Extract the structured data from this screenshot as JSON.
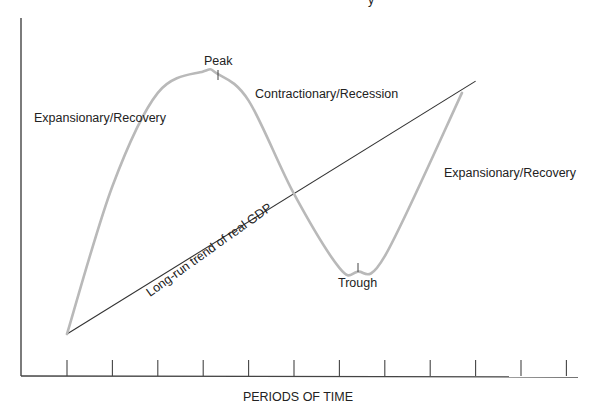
{
  "diagram": {
    "title_fragment": "y",
    "x_axis_title": "PERIODS OF TIME",
    "tick_count": 12,
    "labels": {
      "expansion_left": "Expansionary/Recovery",
      "peak": "Peak",
      "contraction": "Contractionary/Recession",
      "expansion_right": "Expansionary/Recovery",
      "trough": "Trough",
      "trend": "Long-run trend of real GDP"
    },
    "colors": {
      "cycle_curve": "#b9b9b9",
      "trend_line": "#333333",
      "axes": "#444444",
      "text": "#222222"
    }
  },
  "chart_data": {
    "type": "line",
    "title": "",
    "xlabel": "PERIODS OF TIME",
    "ylabel": "",
    "x_ticks": [
      "",
      "",
      "",
      "",
      "",
      "",
      "",
      "",
      "",
      "",
      "",
      ""
    ],
    "series": [
      {
        "name": "Business cycle (real GDP)",
        "style": "smooth-curve",
        "x": [
          0,
          1,
          2,
          3,
          3.3,
          4,
          5,
          6,
          6.4,
          7,
          8.7
        ],
        "y": [
          0,
          3.8,
          6.2,
          6.75,
          6.7,
          6.0,
          3.6,
          1.7,
          1.6,
          2.0,
          6.2
        ]
      },
      {
        "name": "Long-run trend of real GDP",
        "style": "straight-line",
        "x": [
          0,
          9
        ],
        "y": [
          0,
          6.5
        ]
      }
    ],
    "annotations": [
      {
        "text": "Peak",
        "x": 3.3,
        "y": 6.75
      },
      {
        "text": "Trough",
        "x": 6.4,
        "y": 1.6
      },
      {
        "text": "Expansionary/Recovery",
        "phase": "rising before peak"
      },
      {
        "text": "Contractionary/Recession",
        "phase": "falling after peak"
      },
      {
        "text": "Expansionary/Recovery",
        "phase": "rising after trough"
      },
      {
        "text": "Long-run trend of real GDP",
        "phase": "along trend line"
      }
    ],
    "xlim": [
      -1,
      11.3
    ],
    "ylim": [
      -0.9,
      7.4
    ],
    "grid": false,
    "legend": "none"
  }
}
